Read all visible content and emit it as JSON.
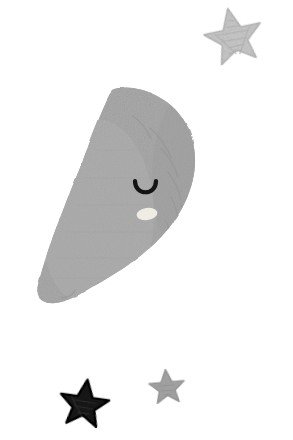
{
  "artwork": {
    "title": "Sleeping Crescent Moon with Stars",
    "style": "hand-drawn chalk / crayon nursery illustration",
    "background_color": "#ffffff",
    "canvas": {
      "width": 293,
      "height": 440
    }
  },
  "palette": {
    "background": "#ffffff",
    "moon_fill": "#a9a9a9",
    "moon_shade": "#9d9d9d",
    "moon_texture_stroke": "#949494",
    "moon_highlight": "#b4b4b4",
    "eye_stroke": "#141414",
    "cheek_fill": "#f2efe6",
    "star_light_fill": "#c9c9c9",
    "star_light_stroke": "#bcbcbc",
    "star_mid_fill": "#a6a6a6",
    "star_mid_stroke": "#9a9a9a",
    "star_dark_fill": "#161616",
    "star_dark_stroke": "#000000"
  },
  "elements": [
    {
      "id": "moon",
      "name": "crescent-moon",
      "label": "Sleeping crescent moon",
      "fill": "#a9a9a9",
      "bbox": {
        "x": 38,
        "y": 89,
        "width": 158,
        "height": 216
      },
      "facing": "right",
      "expression": "sleeping"
    },
    {
      "id": "moon-eye",
      "name": "moon-closed-eye",
      "label": "Closed sleeping eye",
      "stroke": "#141414",
      "bbox": {
        "x": 134,
        "y": 180,
        "width": 23,
        "height": 18
      },
      "shape": "downward-u-arc"
    },
    {
      "id": "moon-cheek",
      "name": "moon-cheek",
      "label": "Cheek highlight",
      "fill": "#f2efe6",
      "bbox": {
        "x": 137,
        "y": 208,
        "width": 20,
        "height": 12
      },
      "shape": "ellipse"
    },
    {
      "id": "star-top-right",
      "name": "star-light-large",
      "label": "Large light gray star",
      "fill": "#c9c9c9",
      "bbox": {
        "x": 203,
        "y": 10,
        "width": 62,
        "height": 56
      },
      "points": 5,
      "rotation_deg": -12
    },
    {
      "id": "star-bottom-left",
      "name": "star-dark",
      "label": "Dark black star",
      "fill": "#161616",
      "bbox": {
        "x": 58,
        "y": 381,
        "width": 52,
        "height": 48
      },
      "points": 5,
      "rotation_deg": 8
    },
    {
      "id": "star-bottom-mid",
      "name": "star-gray-small",
      "label": "Small gray star",
      "fill": "#a6a6a6",
      "bbox": {
        "x": 149,
        "y": 371,
        "width": 37,
        "height": 35
      },
      "points": 5,
      "rotation_deg": -5
    }
  ]
}
